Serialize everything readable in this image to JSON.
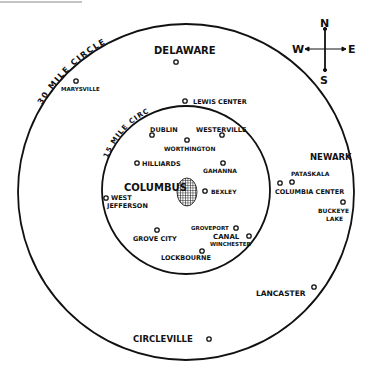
{
  "map": {
    "circles": [
      {
        "label": "30 MILE CIRCLE",
        "cx": 186,
        "cy": 192,
        "r": 168
      },
      {
        "label": "15 MILE CIRCLE",
        "cx": 186,
        "cy": 190,
        "r": 84
      }
    ],
    "center_city": {
      "name": "COLUMBUS",
      "x": 187,
      "y": 192
    },
    "compass": {
      "n": "N",
      "s": "S",
      "e": "E",
      "w": "W"
    },
    "cities": [
      {
        "name": "DELAWARE",
        "x": 176,
        "y": 62
      },
      {
        "name": "MARYSVILLE",
        "x": 76,
        "y": 81
      },
      {
        "name": "LEWIS CENTER",
        "x": 185,
        "y": 101
      },
      {
        "name": "DUBLIN",
        "x": 152,
        "y": 135
      },
      {
        "name": "WESTERVILLE",
        "x": 222,
        "y": 135
      },
      {
        "name": "WORTHINGTON",
        "x": 187,
        "y": 140
      },
      {
        "name": "HILLIARDS",
        "x": 137,
        "y": 163
      },
      {
        "name": "GAHANNA",
        "x": 223,
        "y": 163
      },
      {
        "name": "BEXLEY",
        "x": 205,
        "y": 191
      },
      {
        "name": "WEST JEFFERSON",
        "x": 106,
        "y": 198
      },
      {
        "name": "GROVEPORT",
        "x": 236,
        "y": 228
      },
      {
        "name": "CANAL WINCHESTER",
        "x": 249,
        "y": 236
      },
      {
        "name": "GROVE CITY",
        "x": 157,
        "y": 230
      },
      {
        "name": "LOCKBOURNE",
        "x": 202,
        "y": 251
      },
      {
        "name": "NEWARK",
        "x": 0,
        "y": 0
      },
      {
        "name": "PATASKALA",
        "x": 292,
        "y": 182
      },
      {
        "name": "COLUMBIA CENTER",
        "x": 280,
        "y": 183
      },
      {
        "name": "BUCKEYE LAKE",
        "x": 343,
        "y": 202
      },
      {
        "name": "LANCASTER",
        "x": 314,
        "y": 287
      },
      {
        "name": "CIRCLEVILLE",
        "x": 209,
        "y": 339
      }
    ]
  }
}
